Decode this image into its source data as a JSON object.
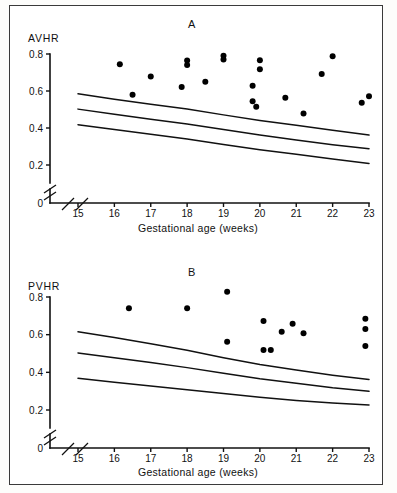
{
  "figure": {
    "background_color": "#ffffff",
    "border_color": "#3a3a3a",
    "ink_color": "#111111",
    "dot_color": "#000000"
  },
  "panel_a": {
    "letter": "A",
    "ylabel": "AVHR",
    "xlabel": "Gestational age (weeks)",
    "y_ticks": [
      "0.8",
      "0.6",
      "0.4",
      "0.2",
      "0"
    ],
    "x_ticks": [
      "15",
      "16",
      "17",
      "18",
      "19",
      "20",
      "21",
      "22",
      "23"
    ]
  },
  "panel_b": {
    "letter": "B",
    "ylabel": "PVHR",
    "xlabel": "Gestational age (weeks)",
    "y_ticks": [
      "0.8",
      "0.6",
      "0.4",
      "0.2",
      "0"
    ],
    "x_ticks": [
      "15",
      "16",
      "17",
      "18",
      "19",
      "20",
      "21",
      "22",
      "23"
    ]
  },
  "chart_data": [
    {
      "type": "scatter",
      "panel": "A",
      "title": "A",
      "xlabel": "Gestational age (weeks)",
      "ylabel": "AVHR",
      "xlim": [
        15,
        23
      ],
      "ylim": [
        0,
        0.8
      ],
      "y_axis_break": true,
      "y_break_between": [
        0.0,
        0.2
      ],
      "x_axis_break": true,
      "grid": false,
      "legend": null,
      "y_ticks": [
        0.2,
        0.4,
        0.6,
        0.8
      ],
      "x_ticks": [
        15,
        16,
        17,
        18,
        19,
        20,
        21,
        22,
        23
      ],
      "series": [
        {
          "name": "AVHR measurements",
          "marker": "filled-circle",
          "points": [
            {
              "x": 16.15,
              "y": 0.745
            },
            {
              "x": 16.5,
              "y": 0.58
            },
            {
              "x": 17.0,
              "y": 0.678
            },
            {
              "x": 17.85,
              "y": 0.622
            },
            {
              "x": 18.0,
              "y": 0.765
            },
            {
              "x": 18.0,
              "y": 0.74
            },
            {
              "x": 18.5,
              "y": 0.65
            },
            {
              "x": 19.0,
              "y": 0.79
            },
            {
              "x": 19.0,
              "y": 0.77
            },
            {
              "x": 19.8,
              "y": 0.628
            },
            {
              "x": 19.8,
              "y": 0.545
            },
            {
              "x": 19.9,
              "y": 0.515
            },
            {
              "x": 20.0,
              "y": 0.766
            },
            {
              "x": 20.0,
              "y": 0.718
            },
            {
              "x": 20.7,
              "y": 0.563
            },
            {
              "x": 21.2,
              "y": 0.478
            },
            {
              "x": 21.7,
              "y": 0.692
            },
            {
              "x": 22.0,
              "y": 0.788
            },
            {
              "x": 22.8,
              "y": 0.537
            },
            {
              "x": 23.0,
              "y": 0.572
            }
          ]
        }
      ],
      "reference_curves": [
        {
          "name": "upper reference limit",
          "x": [
            15,
            16,
            17,
            18,
            19,
            20,
            21,
            22,
            23
          ],
          "y": [
            0.585,
            0.555,
            0.528,
            0.503,
            0.471,
            0.441,
            0.415,
            0.388,
            0.362
          ]
        },
        {
          "name": "median reference",
          "x": [
            15,
            16,
            17,
            18,
            19,
            20,
            21,
            22,
            23
          ],
          "y": [
            0.502,
            0.474,
            0.447,
            0.422,
            0.392,
            0.362,
            0.335,
            0.31,
            0.288
          ]
        },
        {
          "name": "lower reference limit",
          "x": [
            15,
            16,
            17,
            18,
            19,
            20,
            21,
            22,
            23
          ],
          "y": [
            0.418,
            0.392,
            0.366,
            0.341,
            0.311,
            0.283,
            0.258,
            0.232,
            0.208
          ]
        }
      ]
    },
    {
      "type": "scatter",
      "panel": "B",
      "title": "B",
      "xlabel": "Gestational age (weeks)",
      "ylabel": "PVHR",
      "xlim": [
        15,
        23
      ],
      "ylim": [
        0,
        0.8
      ],
      "y_axis_break": true,
      "y_break_between": [
        0.0,
        0.2
      ],
      "x_axis_break": true,
      "grid": false,
      "legend": null,
      "y_ticks": [
        0.2,
        0.4,
        0.6,
        0.8
      ],
      "x_ticks": [
        15,
        16,
        17,
        18,
        19,
        20,
        21,
        22,
        23
      ],
      "series": [
        {
          "name": "PVHR measurements",
          "marker": "filled-circle",
          "points": [
            {
              "x": 16.4,
              "y": 0.74
            },
            {
              "x": 18.0,
              "y": 0.74
            },
            {
              "x": 19.1,
              "y": 0.828
            },
            {
              "x": 19.1,
              "y": 0.562
            },
            {
              "x": 20.1,
              "y": 0.672
            },
            {
              "x": 20.1,
              "y": 0.518
            },
            {
              "x": 20.3,
              "y": 0.518
            },
            {
              "x": 20.6,
              "y": 0.615
            },
            {
              "x": 20.9,
              "y": 0.658
            },
            {
              "x": 21.2,
              "y": 0.608
            },
            {
              "x": 22.9,
              "y": 0.685
            },
            {
              "x": 22.9,
              "y": 0.63
            },
            {
              "x": 22.9,
              "y": 0.54
            }
          ]
        }
      ],
      "reference_curves": [
        {
          "name": "upper reference limit",
          "x": [
            15,
            16,
            17,
            18,
            19,
            20,
            21,
            22,
            23
          ],
          "y": [
            0.615,
            0.585,
            0.552,
            0.517,
            0.478,
            0.442,
            0.412,
            0.385,
            0.362
          ]
        },
        {
          "name": "median reference",
          "x": [
            15,
            16,
            17,
            18,
            19,
            20,
            21,
            22,
            23
          ],
          "y": [
            0.503,
            0.478,
            0.452,
            0.425,
            0.395,
            0.366,
            0.342,
            0.318,
            0.299
          ]
        },
        {
          "name": "lower reference limit",
          "x": [
            15,
            16,
            17,
            18,
            19,
            20,
            21,
            22,
            23
          ],
          "y": [
            0.368,
            0.348,
            0.328,
            0.308,
            0.288,
            0.268,
            0.251,
            0.237,
            0.227
          ]
        }
      ]
    }
  ]
}
